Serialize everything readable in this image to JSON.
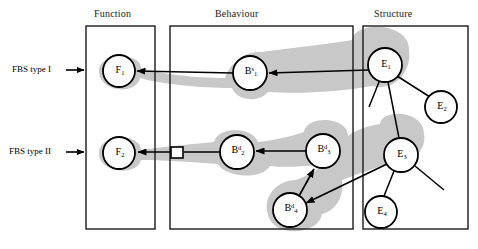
{
  "diagram": {
    "panels": [
      {
        "id": "function",
        "label": "Function",
        "x": 86,
        "y": 26,
        "w": 69,
        "h": 203,
        "title_x": 94,
        "title_y": 10
      },
      {
        "id": "behaviour",
        "label": "Behaviour",
        "x": 170,
        "y": 26,
        "w": 183,
        "h": 203,
        "title_x": 228,
        "title_y": 10
      },
      {
        "id": "structure",
        "label": "Structure",
        "x": 363,
        "y": 26,
        "w": 105,
        "h": 203,
        "title_x": 382,
        "title_y": 10
      }
    ],
    "row_labels": [
      {
        "id": "fbs-type-i",
        "text": "FBS type I",
        "x": 12,
        "y": 66,
        "arrow_x1": 66,
        "arrow_x2": 85,
        "arrow_y": 70
      },
      {
        "id": "fbs-type-ii",
        "text": "FBS type II",
        "x": 9,
        "y": 148,
        "arrow_x1": 66,
        "arrow_x2": 85,
        "arrow_y": 152
      }
    ],
    "nodes": [
      {
        "id": "F1",
        "base": "F",
        "sub": "1",
        "sup": "",
        "cx": 119,
        "cy": 71,
        "r": 16,
        "highlighted": true
      },
      {
        "id": "F2",
        "base": "F",
        "sub": "2",
        "sup": "",
        "cx": 119,
        "cy": 153,
        "r": 16,
        "highlighted": true
      },
      {
        "id": "B1s",
        "base": "B",
        "sub": "1",
        "sup": "s",
        "cx": 250,
        "cy": 73,
        "r": 17,
        "highlighted": true
      },
      {
        "id": "B2d",
        "base": "B",
        "sub": "2",
        "sup": "d",
        "cx": 237,
        "cy": 152,
        "r": 17,
        "highlighted": true
      },
      {
        "id": "B3d",
        "base": "B",
        "sub": "3",
        "sup": "d",
        "cx": 323,
        "cy": 151,
        "r": 17,
        "highlighted": true
      },
      {
        "id": "B4d",
        "base": "B",
        "sub": "4",
        "sup": "d",
        "cx": 290,
        "cy": 210,
        "r": 17,
        "highlighted": true
      },
      {
        "id": "E1",
        "base": "E",
        "sub": "1",
        "sup": "",
        "cx": 385,
        "cy": 65,
        "r": 17,
        "highlighted": true
      },
      {
        "id": "E2",
        "base": "E",
        "sub": "2",
        "sup": "",
        "cx": 441,
        "cy": 107,
        "r": 16,
        "highlighted": false
      },
      {
        "id": "E3",
        "base": "E",
        "sub": "3",
        "sup": "",
        "cx": 401,
        "cy": 155,
        "r": 17,
        "highlighted": true
      },
      {
        "id": "E4",
        "base": "E",
        "sub": "4",
        "sup": "",
        "cx": 381,
        "cy": 212,
        "r": 16,
        "highlighted": false
      }
    ],
    "comparison_node": {
      "id": "comparison-square",
      "x": 171,
      "y": 147,
      "w": 12,
      "h": 11
    },
    "arrows": [
      {
        "id": "e1-to-b1s",
        "x1": 369,
        "y1": 71,
        "x2": 268,
        "y2": 73
      },
      {
        "id": "b1s-to-f1",
        "x1": 233,
        "y1": 73,
        "x2": 137,
        "y2": 71
      },
      {
        "id": "b3d-to-b2d",
        "x1": 306,
        "y1": 151,
        "x2": 255,
        "y2": 151
      },
      {
        "id": "b2d-to-sq",
        "x1": 220,
        "y1": 152,
        "x2": 184,
        "y2": 152
      },
      {
        "id": "sq-to-f2",
        "x1": 170,
        "y1": 152,
        "x2": 137,
        "y2": 152
      },
      {
        "id": "e3-to-b4d",
        "x1": 387,
        "y1": 163,
        "x2": 305,
        "y2": 203
      },
      {
        "id": "b4d-to-b3d",
        "x1": 300,
        "y1": 196,
        "x2": 315,
        "y2": 168
      }
    ],
    "structure_links": [
      {
        "id": "e1-to-e2",
        "x1": 397,
        "y1": 76,
        "x2": 430,
        "y2": 97
      },
      {
        "id": "e1-to-e3",
        "x1": 388,
        "y1": 82,
        "x2": 399,
        "y2": 138
      },
      {
        "id": "e1-free-a",
        "x1": 379,
        "y1": 82,
        "x2": 369,
        "y2": 107
      },
      {
        "id": "e3-to-e4",
        "x1": 394,
        "y1": 171,
        "x2": 384,
        "y2": 196
      },
      {
        "id": "e3-free-b",
        "x1": 415,
        "y1": 166,
        "x2": 444,
        "y2": 190
      }
    ],
    "colors": {
      "blob": "#c8c8c8",
      "stroke": "#000000",
      "panel_border": "#1a1a1a",
      "node_fill": "#ffffff",
      "background": "#ffffff"
    }
  }
}
